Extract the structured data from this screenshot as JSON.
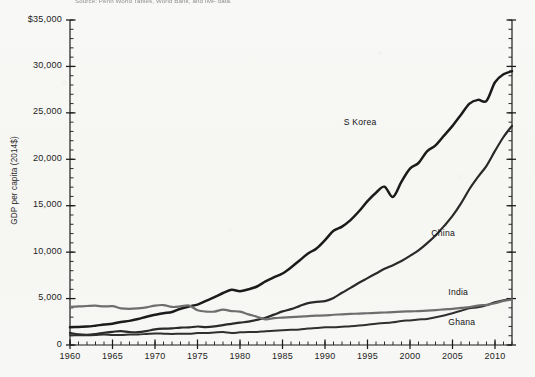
{
  "caption": "Source: Penn World Tables, World Bank, and IMF data.",
  "chart_data": {
    "type": "line",
    "title": "",
    "xlabel": "",
    "ylabel": "GDP per capita (2014$)",
    "xlim": [
      1960,
      2012
    ],
    "ylim": [
      0,
      35000
    ],
    "grid": false,
    "legend_position": "inline-right",
    "y_ticks": [
      {
        "value": 35000,
        "label": "$35,000"
      },
      {
        "value": 30000,
        "label": "30,000"
      },
      {
        "value": 25000,
        "label": "25,000"
      },
      {
        "value": 20000,
        "label": "20,000"
      },
      {
        "value": 15000,
        "label": "15,000"
      },
      {
        "value": 10000,
        "label": "10,000"
      },
      {
        "value": 5000,
        "label": "5,000"
      },
      {
        "value": 0,
        "label": "0"
      }
    ],
    "y_minor_step": 1000,
    "x_ticks": [
      {
        "value": 1960,
        "label": "1960"
      },
      {
        "value": 1965,
        "label": "1965"
      },
      {
        "value": 1970,
        "label": "1970"
      },
      {
        "value": 1975,
        "label": "1975"
      },
      {
        "value": 1980,
        "label": "1980"
      },
      {
        "value": 1985,
        "label": "1985"
      },
      {
        "value": 1990,
        "label": "1990"
      },
      {
        "value": 1995,
        "label": "1995"
      },
      {
        "value": 2000,
        "label": "2000"
      },
      {
        "value": 2005,
        "label": "2005"
      },
      {
        "value": 2010,
        "label": "2010"
      }
    ],
    "x_minor_step": 1,
    "x": [
      1960,
      1961,
      1962,
      1963,
      1964,
      1965,
      1966,
      1967,
      1968,
      1969,
      1970,
      1971,
      1972,
      1973,
      1974,
      1975,
      1976,
      1977,
      1978,
      1979,
      1980,
      1981,
      1982,
      1983,
      1984,
      1985,
      1986,
      1987,
      1988,
      1989,
      1990,
      1991,
      1992,
      1993,
      1994,
      1995,
      1996,
      1997,
      1998,
      1999,
      2000,
      2001,
      2002,
      2003,
      2004,
      2005,
      2006,
      2007,
      2008,
      2009,
      2010,
      2011,
      2012
    ],
    "series": [
      {
        "name": "S Korea",
        "color": "#1b1b1b",
        "width": 2.5,
        "label_x": 1992.2,
        "label_y": 23900,
        "values": [
          1900,
          1950,
          1980,
          2080,
          2200,
          2300,
          2480,
          2600,
          2800,
          3050,
          3250,
          3430,
          3560,
          3900,
          4150,
          4350,
          4750,
          5150,
          5600,
          5950,
          5800,
          6000,
          6300,
          6850,
          7300,
          7700,
          8350,
          9100,
          9850,
          10400,
          11300,
          12300,
          12750,
          13450,
          14400,
          15500,
          16400,
          17050,
          15950,
          17600,
          19000,
          19600,
          20850,
          21500,
          22550,
          23600,
          24800,
          26000,
          26400,
          26300,
          28300,
          29150,
          29500
        ],
        "values_note": "S Korea rises steeply; 1997-98 Asian crisis dip and 2008-09 dip visible; ends about 33,200 at right edge"
      },
      {
        "name": "China",
        "color": "#2a2a2a",
        "width": 2.2,
        "label_x": 2002.5,
        "label_y": 12000,
        "values": [
          1300,
          1150,
          1100,
          1180,
          1320,
          1420,
          1500,
          1400,
          1380,
          1500,
          1680,
          1760,
          1790,
          1880,
          1890,
          1990,
          1930,
          2000,
          2150,
          2280,
          2410,
          2520,
          2700,
          2940,
          3270,
          3620,
          3860,
          4190,
          4510,
          4640,
          4730,
          5070,
          5620,
          6150,
          6700,
          7200,
          7700,
          8200,
          8600,
          9050,
          9600,
          10200,
          10950,
          11800,
          12800,
          13900,
          15250,
          16800,
          18100,
          19300,
          20900,
          22400,
          23600
        ],
        "values_note": "China flat/low until ~1980 then accelerating; ends about 11,000 at right edge"
      },
      {
        "name": "India",
        "color": "#303030",
        "width": 2.0,
        "label_x": 2004.5,
        "label_y": 5600,
        "values": [
          1050,
          1060,
          1060,
          1090,
          1140,
          1090,
          1070,
          1120,
          1140,
          1190,
          1240,
          1220,
          1190,
          1220,
          1210,
          1290,
          1280,
          1340,
          1390,
          1290,
          1360,
          1400,
          1410,
          1490,
          1530,
          1580,
          1630,
          1680,
          1780,
          1840,
          1910,
          1900,
          1960,
          2010,
          2090,
          2190,
          2300,
          2360,
          2450,
          2590,
          2650,
          2740,
          2800,
          2980,
          3180,
          3420,
          3680,
          3960,
          4060,
          4280,
          4600,
          4820,
          4950
        ],
        "values_note": "India slowly rising, steeper after 2000; ends about 4,800"
      },
      {
        "name": "Ghana",
        "color": "#6e6e6e",
        "width": 2.2,
        "label_x": 2004.5,
        "label_y": 2400,
        "values": [
          4100,
          4150,
          4200,
          4230,
          4150,
          4180,
          3950,
          3900,
          3950,
          4050,
          4250,
          4300,
          4100,
          4150,
          4250,
          3750,
          3600,
          3600,
          3800,
          3650,
          3600,
          3300,
          3050,
          2750,
          2900,
          2950,
          3000,
          3050,
          3120,
          3160,
          3180,
          3260,
          3300,
          3350,
          3380,
          3420,
          3470,
          3500,
          3540,
          3590,
          3620,
          3650,
          3700,
          3760,
          3830,
          3900,
          4000,
          4080,
          4250,
          4320,
          4500,
          4750,
          4900
        ],
        "values_note": "Ghana starts highest near 4,100, declines through the 1970s-80s to about 2,800, then slowly recovers to about 3,800 at right edge"
      }
    ]
  },
  "axis": {
    "y_title": "GDP per capita (2014$)"
  }
}
